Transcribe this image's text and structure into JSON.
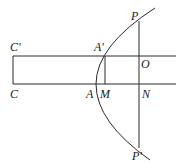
{
  "diagram": {
    "type": "geometry",
    "stroke_color": "#2a2a2a",
    "labels": {
      "C_prime": "C'",
      "C": "C",
      "A_prime": "A'",
      "A": "A",
      "M": "M",
      "O": "O",
      "N": "N",
      "P": "P",
      "P_prime": "P'"
    }
  }
}
